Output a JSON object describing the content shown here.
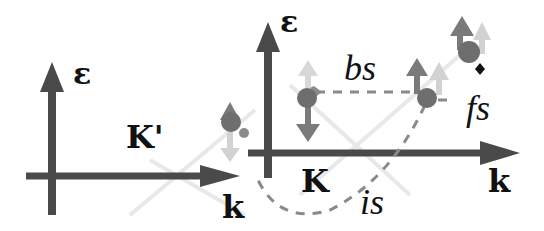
{
  "diagram": {
    "type": "two-valley band diagram with spin scattering",
    "colors": {
      "axis": "#4a4a4a",
      "electron": "#6e6e6e",
      "spin_dark": "#7a7a7a",
      "spin_light": "#cfcfcf",
      "dashed_path": "#8a8a8a",
      "faint_bands": "#e6e6e6",
      "text": "#111111"
    },
    "left_valley": {
      "energy_axis_label": "ε",
      "momentum_axis_label": "k",
      "valley_label": "K'"
    },
    "right_valley": {
      "energy_axis_label": "ε",
      "momentum_axis_label": "k",
      "valley_label": "K"
    },
    "processes": {
      "backscattering": "bs",
      "forward_scattering": "fs",
      "intervalley_scattering": "is"
    },
    "icons": {
      "electron": "filled-circle",
      "spin_up": "arrow-up",
      "spin_down": "arrow-down"
    }
  }
}
